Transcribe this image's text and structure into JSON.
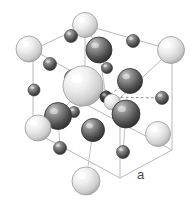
{
  "figure": {
    "kind": "crystal-lattice-unit-cell",
    "title": "",
    "background_color": "#ffffff",
    "edge_color": "#b9b9b9",
    "dashed_bond_color": "#8a8a8a",
    "bond_color": "#c2c2c2"
  },
  "annotations": [
    {
      "id": "lattice-constant",
      "text": "a",
      "x": 137,
      "y": 168,
      "color": "#4a4a4a",
      "font_size": 13
    }
  ],
  "cube": {
    "description": "Cubic unit cell drawn in oblique projection",
    "vertices": {
      "front_bottom_left": [
        33,
        131
      ],
      "front_bottom_right": [
        120,
        178
      ],
      "front_top_left": [
        33,
        50
      ],
      "front_top_right": [
        120,
        98
      ],
      "back_bottom_left": [
        85,
        104
      ],
      "back_bottom_right": [
        172,
        150
      ],
      "back_top_left": [
        85,
        25
      ],
      "back_top_right": [
        172,
        50
      ]
    },
    "edges": [
      [
        "front_bottom_left",
        "front_bottom_right"
      ],
      [
        "front_bottom_right",
        "front_top_right"
      ],
      [
        "front_top_right",
        "front_top_left"
      ],
      [
        "front_top_left",
        "front_bottom_left"
      ],
      [
        "back_bottom_left",
        "back_bottom_right"
      ],
      [
        "back_bottom_right",
        "back_top_right"
      ],
      [
        "back_top_right",
        "back_top_left"
      ],
      [
        "back_top_left",
        "back_bottom_left"
      ],
      [
        "front_bottom_left",
        "back_bottom_left"
      ],
      [
        "front_bottom_right",
        "back_bottom_right"
      ],
      [
        "front_top_left",
        "back_top_left"
      ],
      [
        "front_top_right",
        "back_top_right"
      ]
    ]
  },
  "atoms": [
    {
      "id": "corner-back-top-left",
      "label": "light-sphere",
      "x": 85,
      "y": 25,
      "r": 12.5,
      "shade": "light"
    },
    {
      "id": "corner-back-top-right",
      "label": "light-sphere",
      "x": 171,
      "y": 50,
      "r": 13.5,
      "shade": "light"
    },
    {
      "id": "corner-front-top-left",
      "label": "light-sphere",
      "x": 29,
      "y": 49,
      "r": 13.0,
      "shade": "light"
    },
    {
      "id": "corner-front-bot-left",
      "label": "light-sphere",
      "x": 38,
      "y": 128,
      "r": 13.0,
      "shade": "light"
    },
    {
      "id": "corner-back-bot-right",
      "label": "light-sphere",
      "x": 158,
      "y": 134,
      "r": 12.5,
      "shade": "light"
    },
    {
      "id": "corner-front-bot-mid",
      "label": "light-sphere",
      "x": 86,
      "y": 181,
      "r": 14.0,
      "shade": "light"
    },
    {
      "id": "face-center-front",
      "label": "large-light-sphere",
      "x": 83,
      "y": 86,
      "r": 20.0,
      "shade": "light"
    },
    {
      "id": "dark-top-center",
      "label": "dark-sphere",
      "x": 99,
      "y": 50,
      "r": 13.0,
      "shade": "dark"
    },
    {
      "id": "dark-right-upper",
      "label": "dark-sphere",
      "x": 130,
      "y": 81,
      "r": 12.5,
      "shade": "dark"
    },
    {
      "id": "dark-right-mid",
      "label": "dark-sphere",
      "x": 126,
      "y": 114,
      "r": 14.0,
      "shade": "dark"
    },
    {
      "id": "dark-left-mid",
      "label": "dark-sphere",
      "x": 58,
      "y": 116,
      "r": 13.5,
      "shade": "dark"
    },
    {
      "id": "dark-center-low",
      "label": "dark-sphere",
      "x": 93,
      "y": 130,
      "r": 11.5,
      "shade": "dark"
    },
    {
      "id": "dark-left-upper-small",
      "label": "dark-sphere",
      "x": 73,
      "y": 78,
      "r": 8.5,
      "shade": "dark"
    },
    {
      "id": "dark-center-right-small",
      "label": "dark-sphere",
      "x": 106,
      "y": 97,
      "r": 6.0,
      "shade": "darkest"
    },
    {
      "id": "light-small-right",
      "label": "light-small-sphere",
      "x": 112,
      "y": 102,
      "r": 8.0,
      "shade": "light"
    },
    {
      "id": "edge-top-left",
      "label": "small-dark-sphere",
      "x": 71,
      "y": 36,
      "r": 6.5,
      "shade": "dark"
    },
    {
      "id": "edge-top-right",
      "label": "small-dark-sphere",
      "x": 133,
      "y": 41,
      "r": 6.5,
      "shade": "dark"
    },
    {
      "id": "edge-left-upper",
      "label": "small-dark-sphere",
      "x": 50,
      "y": 64,
      "r": 6.5,
      "shade": "dark"
    },
    {
      "id": "edge-mid-top",
      "label": "small-dark-sphere",
      "x": 107,
      "y": 68,
      "r": 5.5,
      "shade": "dark"
    },
    {
      "id": "edge-left-lower",
      "label": "small-dark-sphere",
      "x": 34,
      "y": 90,
      "r": 6.0,
      "shade": "dark"
    },
    {
      "id": "edge-right-upper",
      "label": "small-dark-sphere",
      "x": 162,
      "y": 98,
      "r": 6.5,
      "shade": "dark"
    },
    {
      "id": "edge-center-small",
      "label": "small-dark-sphere",
      "x": 74,
      "y": 112,
      "r": 5.5,
      "shade": "dark"
    },
    {
      "id": "edge-bottom-left",
      "label": "small-dark-sphere",
      "x": 60,
      "y": 148,
      "r": 6.5,
      "shade": "dark"
    },
    {
      "id": "edge-bottom-right",
      "label": "small-dark-sphere",
      "x": 123,
      "y": 152,
      "r": 6.5,
      "shade": "dark"
    }
  ],
  "bonds": [
    {
      "from": [
        85,
        25
      ],
      "to": [
        99,
        50
      ],
      "style": "solid"
    },
    {
      "from": [
        99,
        50
      ],
      "to": [
        106,
        97
      ],
      "style": "solid"
    },
    {
      "from": [
        83,
        86
      ],
      "to": [
        106,
        97
      ],
      "style": "solid"
    },
    {
      "from": [
        106,
        97
      ],
      "to": [
        130,
        81
      ],
      "style": "dashed"
    },
    {
      "from": [
        106,
        97
      ],
      "to": [
        162,
        98
      ],
      "style": "dashed"
    },
    {
      "from": [
        106,
        97
      ],
      "to": [
        126,
        114
      ],
      "style": "dashed"
    },
    {
      "from": [
        83,
        86
      ],
      "to": [
        58,
        116
      ],
      "style": "solid"
    },
    {
      "from": [
        83,
        86
      ],
      "to": [
        73,
        78
      ],
      "style": "solid"
    },
    {
      "from": [
        93,
        130
      ],
      "to": [
        86,
        181
      ],
      "style": "solid"
    },
    {
      "from": [
        126,
        114
      ],
      "to": [
        123,
        152
      ],
      "style": "solid"
    },
    {
      "from": [
        58,
        116
      ],
      "to": [
        60,
        148
      ],
      "style": "solid"
    }
  ]
}
